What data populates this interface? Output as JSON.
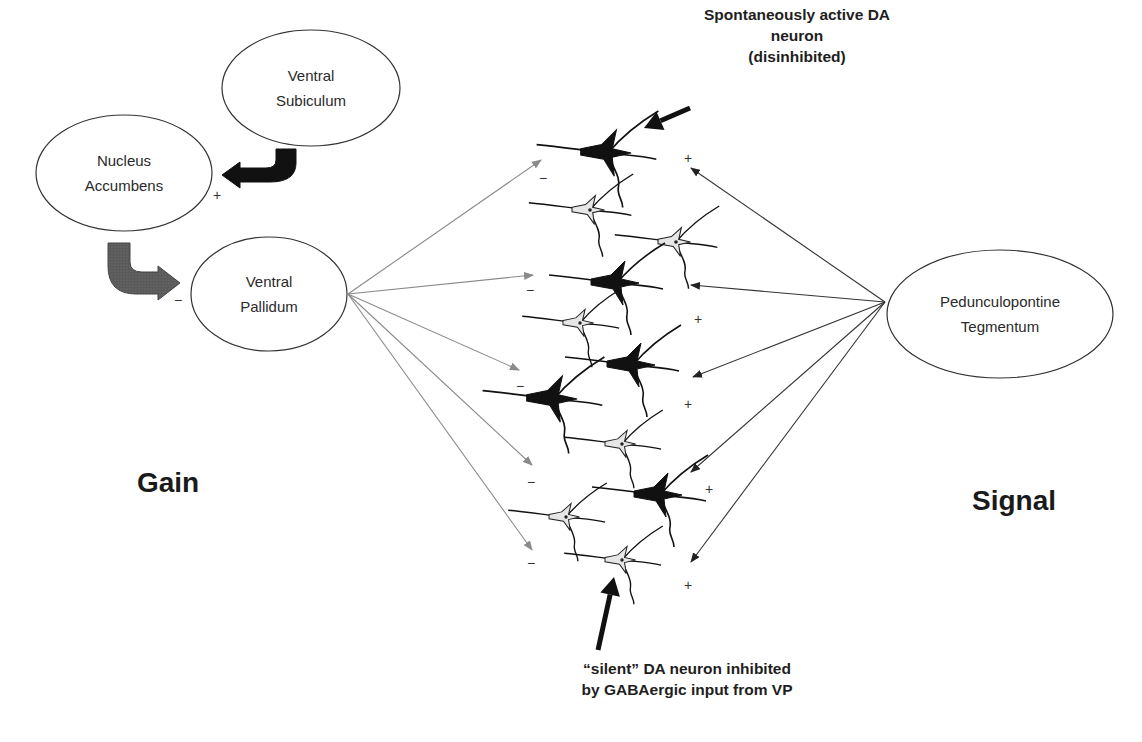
{
  "diagram": {
    "nodes": [
      {
        "id": "ventral-subiculum",
        "label_lines": [
          "Ventral",
          "Subiculum"
        ],
        "cx": 311,
        "cy": 88,
        "rx": 89,
        "ry": 58
      },
      {
        "id": "nucleus-accumbens",
        "label_lines": [
          "Nucleus",
          "Accumbens"
        ],
        "cx": 124,
        "cy": 173,
        "rx": 88,
        "ry": 58
      },
      {
        "id": "ventral-pallidum",
        "label_lines": [
          "Ventral",
          "Pallidum"
        ],
        "cx": 269,
        "cy": 294,
        "rx": 78,
        "ry": 57
      },
      {
        "id": "pedunculopontine-tegmentum",
        "label_lines": [
          "Pedunculopontine",
          "Tegmentum"
        ],
        "cx": 1000,
        "cy": 314,
        "rx": 113,
        "ry": 64
      }
    ],
    "side_labels": {
      "gain": {
        "text": "Gain",
        "x": 168,
        "y": 483
      },
      "signal": {
        "text": "Signal",
        "x": 1014,
        "y": 501
      }
    },
    "callouts": {
      "active": {
        "lines": [
          "Spontaneously active DA",
          "neuron",
          "(disinhibited)"
        ],
        "x": 797,
        "y": 58
      },
      "silent": {
        "lines": [
          "“silent” DA neuron inhibited",
          "by GABAergic input from VP"
        ],
        "x": 687,
        "y": 661
      }
    },
    "block_arrows": [
      {
        "id": "vs-to-nac",
        "from": "Ventral Subiculum",
        "to": "Nucleus Accumbens",
        "color": "#111111",
        "sign": "+",
        "sign_x": 217,
        "sign_y": 195
      },
      {
        "id": "nac-to-vp",
        "from": "Nucleus Accumbens",
        "to": "Ventral Pallidum",
        "color": "#5a5a5a",
        "sign": "−",
        "sign_x": 178,
        "sign_y": 300
      }
    ],
    "vp_projections": {
      "color": "#8a8a8a",
      "origin": [
        348,
        294
      ],
      "targets": [
        [
          541,
          160
        ],
        [
          533,
          275
        ],
        [
          519,
          370
        ],
        [
          532,
          465
        ],
        [
          532,
          550
        ]
      ],
      "sign": "−",
      "sign_positions": [
        [
          543,
          178
        ],
        [
          530,
          290
        ],
        [
          520,
          386
        ],
        [
          531,
          482
        ],
        [
          531,
          563
        ]
      ]
    },
    "ppt_projections": {
      "color": "#333333",
      "origin": [
        885,
        302
      ],
      "targets": [
        [
          691,
          168
        ],
        [
          691,
          285
        ],
        [
          693,
          377
        ],
        [
          691,
          472
        ],
        [
          691,
          562
        ]
      ],
      "sign": "+",
      "sign_positions": [
        [
          688,
          158
        ],
        [
          698,
          319
        ],
        [
          688,
          404
        ],
        [
          709,
          489
        ],
        [
          688,
          585
        ]
      ]
    },
    "neurons": [
      {
        "x": 608,
        "y": 153,
        "type": "active",
        "scale": 1.05,
        "rot": 0
      },
      {
        "x": 590,
        "y": 210,
        "type": "silent",
        "scale": 0.9,
        "rot": 0
      },
      {
        "x": 676,
        "y": 242,
        "type": "silent",
        "scale": 0.9,
        "rot": 0
      },
      {
        "x": 617,
        "y": 283,
        "type": "active",
        "scale": 1.0,
        "rot": 0
      },
      {
        "x": 580,
        "y": 323,
        "type": "silent",
        "scale": 0.85,
        "rot": 0
      },
      {
        "x": 633,
        "y": 365,
        "type": "active",
        "scale": 1.0,
        "rot": 0
      },
      {
        "x": 554,
        "y": 399,
        "type": "active",
        "scale": 1.05,
        "rot": 0
      },
      {
        "x": 622,
        "y": 444,
        "type": "silent",
        "scale": 0.85,
        "rot": 0
      },
      {
        "x": 660,
        "y": 495,
        "type": "active",
        "scale": 1.0,
        "rot": 0
      },
      {
        "x": 566,
        "y": 517,
        "type": "silent",
        "scale": 0.85,
        "rot": 0
      },
      {
        "x": 622,
        "y": 560,
        "type": "silent",
        "scale": 0.85,
        "rot": 0
      }
    ],
    "pointer_arrows": [
      {
        "id": "active-pointer",
        "from": [
          690,
          108
        ],
        "to": [
          644,
          128
        ]
      },
      {
        "id": "silent-pointer",
        "from": [
          598,
          650
        ],
        "to": [
          614,
          577
        ]
      }
    ]
  }
}
